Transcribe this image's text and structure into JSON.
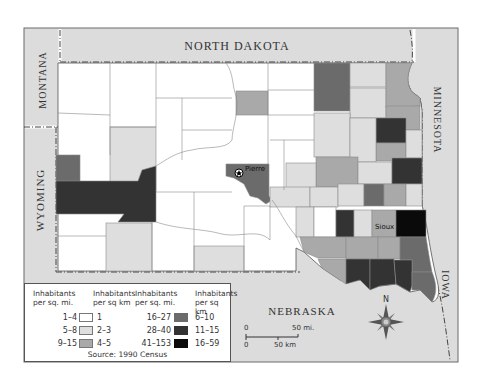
{
  "map": {
    "title": "South Dakota population density by county",
    "neighbors": {
      "north_dakota": "NORTH DAKOTA",
      "montana": "MONTANA",
      "wyoming": "WYOMING",
      "minnesota": "MINNESOTA",
      "iowa": "IOWA",
      "nebraska": "NEBRASKA"
    },
    "cities": [
      {
        "name": "Pierre",
        "capital": true
      },
      {
        "name": "Sioux",
        "capital": false
      }
    ],
    "colors": {
      "frame_bg": "#dcdcdc",
      "class_1": "#ffffff",
      "class_2": "#dedede",
      "class_3": "#a9a9a9",
      "class_4": "#6b6b6b",
      "class_5": "#333333",
      "class_6": "#0a0a0a"
    }
  },
  "legend": {
    "header_mi": "Inhabitants per sq. mi.",
    "header_km": "Inhabitants per sq km",
    "header_mi_2": "Inhabitants per sq. mi.",
    "header_km_2": "Inhabitants per sq km",
    "classes": [
      {
        "mi": "1–4",
        "km": "1"
      },
      {
        "mi": "5–8",
        "km": "2–3"
      },
      {
        "mi": "9–15",
        "km": "4–5"
      },
      {
        "mi": "16–27",
        "km": "6–10"
      },
      {
        "mi": "28–40",
        "km": "11–15"
      },
      {
        "mi": "41–153",
        "km": "16–59"
      }
    ],
    "source": "Source: 1990 Census"
  },
  "scale": {
    "mi_zero": "0",
    "mi_label": "50 mi.",
    "km_zero": "0",
    "km_label": "50 km"
  },
  "compass": {
    "north_label": "N"
  }
}
